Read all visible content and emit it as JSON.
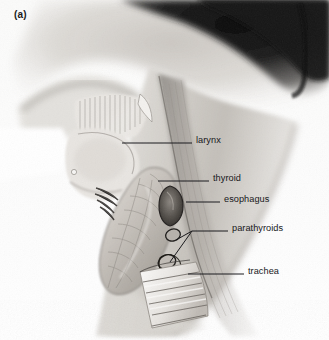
{
  "figure": {
    "panel_label": "(a)",
    "style": "pencil/airbrush anatomical illustration, grayscale scan",
    "background_color": "#fdfdfc",
    "ink_color": "#17171a",
    "hair_shadow_color": "#1a1a1a",
    "skin_tone_color": "#cfcbc6"
  },
  "labels": [
    {
      "id": "larynx",
      "text": "larynx",
      "text_x": 196,
      "text_y": 140,
      "leader_x1": 122,
      "leader_y1": 143,
      "leader_x2": 192,
      "leader_y2": 143
    },
    {
      "id": "thyroid",
      "text": "thyroid",
      "text_x": 213,
      "text_y": 178,
      "leader_x1": 158,
      "leader_y1": 181,
      "leader_x2": 209,
      "leader_y2": 181
    },
    {
      "id": "esophagus",
      "text": "esophagus",
      "text_x": 224,
      "text_y": 199,
      "leader_x1": 186,
      "leader_y1": 202,
      "leader_x2": 220,
      "leader_y2": 202
    },
    {
      "id": "parathyroids",
      "text": "parathyroids",
      "text_x": 232,
      "text_y": 228,
      "leader_x1": 192,
      "leader_y1": 231,
      "leader_x2": 228,
      "leader_y2": 231
    },
    {
      "id": "trachea",
      "text": "trachea",
      "text_x": 248,
      "text_y": 271,
      "leader_x1": 188,
      "leader_y1": 274,
      "leader_x2": 244,
      "leader_y2": 274
    }
  ],
  "structures": [
    {
      "id": "hair",
      "name": "hair / occipital shading"
    },
    {
      "id": "jaw",
      "name": "mandible and chin contour"
    },
    {
      "id": "neck",
      "name": "neck skin surface"
    },
    {
      "id": "sternocleidomastoid",
      "name": "sternocleidomastoid muscle band"
    },
    {
      "id": "strap-muscles",
      "name": "striated strap muscles above larynx"
    },
    {
      "id": "larynx-body",
      "name": "laryngeal prominence"
    },
    {
      "id": "thyroid-gland",
      "name": "lobulated thyroid gland"
    },
    {
      "id": "esophagus-tube",
      "name": "esophagus, dark vertical tube"
    },
    {
      "id": "parathyroid-upper",
      "name": "superior parathyroid gland"
    },
    {
      "id": "parathyroid-lower",
      "name": "inferior parathyroid gland"
    },
    {
      "id": "trachea-rings",
      "name": "tracheal cartilage rings"
    }
  ]
}
